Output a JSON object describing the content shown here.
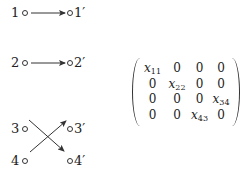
{
  "mapping": {
    "sources": [
      {
        "label": "1"
      },
      {
        "label": "2"
      },
      {
        "label": "3"
      },
      {
        "label": "4"
      }
    ],
    "targets": [
      {
        "label": "1′"
      },
      {
        "label": "2′"
      },
      {
        "label": "3′"
      },
      {
        "label": "4′"
      }
    ],
    "edges": [
      {
        "from": "1",
        "to": "1′"
      },
      {
        "from": "2",
        "to": "2′"
      },
      {
        "from": "3",
        "to": "4′"
      },
      {
        "from": "4",
        "to": "3′"
      }
    ]
  },
  "matrix": {
    "rows": [
      [
        {
          "v": "x",
          "s": "11"
        },
        {
          "v": "0"
        },
        {
          "v": "0"
        },
        {
          "v": "0"
        }
      ],
      [
        {
          "v": "0"
        },
        {
          "v": "x",
          "s": "22"
        },
        {
          "v": "0"
        },
        {
          "v": "0"
        }
      ],
      [
        {
          "v": "0"
        },
        {
          "v": "0"
        },
        {
          "v": "0"
        },
        {
          "v": "x",
          "s": "34"
        }
      ],
      [
        {
          "v": "0"
        },
        {
          "v": "0"
        },
        {
          "v": "x",
          "s": "43"
        },
        {
          "v": "0"
        }
      ]
    ]
  }
}
